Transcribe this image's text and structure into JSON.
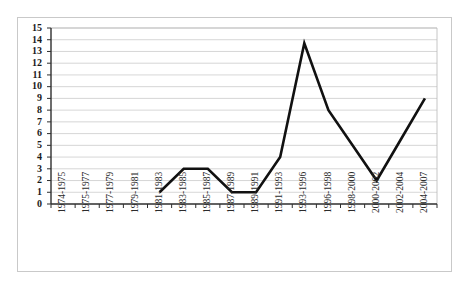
{
  "chart_data": {
    "type": "line",
    "title": "",
    "subtitle": "",
    "xlabel": "",
    "ylabel": "",
    "categories": [
      "1974-1975",
      "1975-1977",
      "1977-1979",
      "1979-1981",
      "1981-1983",
      "1983-1985",
      "1985-1987",
      "1987-1989",
      "1989-1991",
      "1991-1993",
      "1993-1996",
      "1996-1998",
      "1998-2000",
      "2000-2002",
      "2002-2004",
      "2004-2007"
    ],
    "series": [
      {
        "name": "",
        "values": [
          null,
          null,
          null,
          null,
          1,
          3,
          3,
          1,
          1,
          4,
          13.7,
          8,
          5,
          2,
          5.5,
          9
        ]
      }
    ],
    "ylim": [
      0,
      15
    ],
    "ytick_step": 1,
    "ytick_labels": [
      "0",
      "1",
      "2",
      "3",
      "4",
      "5",
      "6",
      "7",
      "8",
      "9",
      "10",
      "11",
      "12",
      "13",
      "14",
      "15"
    ],
    "grid": true,
    "grid_axis": "y",
    "legend": false,
    "legend_position": "none",
    "line_color": "#111111",
    "grid_color": "#c4c4c4",
    "axis_color": "#2e2e2e",
    "background_color": "#ffffff",
    "annotations": []
  }
}
